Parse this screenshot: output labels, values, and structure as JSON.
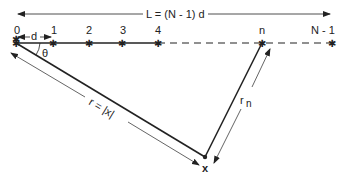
{
  "diagram": {
    "length_label": "L = (N - 1) d",
    "spacing_label": "d",
    "angle_label": "θ",
    "r_label": "r = |x|",
    "rn_label": "r",
    "rn_sub": "n",
    "point_label": "x",
    "nodes": [
      {
        "label": "0",
        "x": 16
      },
      {
        "label": "1",
        "x": 53
      },
      {
        "label": "2",
        "x": 89
      },
      {
        "label": "3",
        "x": 122
      },
      {
        "label": "4",
        "x": 158
      },
      {
        "label": "n",
        "x": 262
      },
      {
        "label": "N - 1",
        "x": 332
      }
    ],
    "colors": {
      "line": "#222222",
      "background": "#ffffff"
    }
  }
}
